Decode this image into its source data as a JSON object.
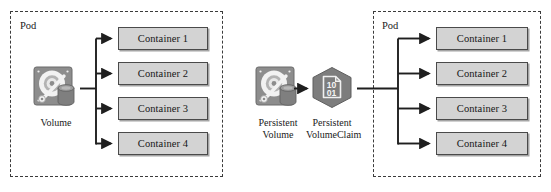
{
  "diagram": {
    "colors": {
      "container_fill": "#d3d3d3",
      "container_border": "#4a4a4a",
      "pod_border": "#3b3b3b",
      "icon_fill": "#8d8d8d",
      "icon_dark": "#6e6e6e",
      "line": "#262626",
      "background": "#ffffff"
    },
    "left_group": {
      "pod_label": "Pod",
      "source": {
        "icon": "hard-disk-volume-icon",
        "caption": "Volume"
      },
      "containers": [
        {
          "label": "Container 1"
        },
        {
          "label": "Container 2"
        },
        {
          "label": "Container 3"
        },
        {
          "label": "Container 4"
        }
      ]
    },
    "right_group": {
      "pod_label": "Pod",
      "persistent_volume": {
        "icon": "hard-disk-volume-icon",
        "caption_line_1": "Persistent",
        "caption_line_2": "Volume"
      },
      "persistent_volume_claim": {
        "icon": "hexagon-binary-document-icon",
        "binary_top": "10",
        "binary_bottom": "01",
        "caption_line_1": "Persistent",
        "caption_line_2": "VolumeClaim"
      },
      "containers": [
        {
          "label": "Container 1"
        },
        {
          "label": "Container 2"
        },
        {
          "label": "Container 3"
        },
        {
          "label": "Container 4"
        }
      ]
    }
  }
}
